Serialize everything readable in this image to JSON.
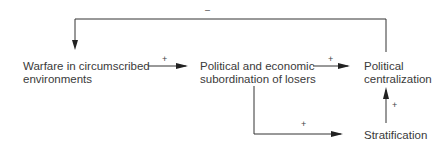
{
  "diagram": {
    "nodes": [
      {
        "id": "warfare",
        "line1": "Warfare in circumscribed",
        "line2": "environments"
      },
      {
        "id": "subordination",
        "line1": "Political and economic",
        "line2": "subordination of losers"
      },
      {
        "id": "centralization",
        "line1": "Political",
        "line2": "centralization"
      },
      {
        "id": "stratification",
        "line1": "Stratification"
      }
    ],
    "edges": [
      {
        "from": "warfare",
        "to": "subordination",
        "sign": "+"
      },
      {
        "from": "subordination",
        "to": "centralization",
        "sign": "+"
      },
      {
        "from": "subordination",
        "to": "stratification",
        "sign": "+"
      },
      {
        "from": "stratification",
        "to": "centralization",
        "sign": "+"
      },
      {
        "from": "centralization",
        "to": "warfare",
        "sign": "–"
      }
    ]
  }
}
